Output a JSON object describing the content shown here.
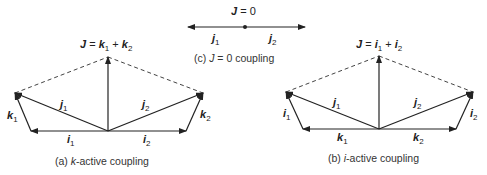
{
  "diagram_a": {
    "equation": {
      "lhs": "J",
      "eq": " = ",
      "v1": "k",
      "s1": "1",
      "plus": " + ",
      "v2": "k",
      "s2": "2"
    },
    "labels": {
      "j1": {
        "v": "j",
        "s": "1"
      },
      "j2": {
        "v": "j",
        "s": "2"
      },
      "k1": {
        "v": "k",
        "s": "1"
      },
      "k2": {
        "v": "k",
        "s": "2"
      },
      "i1": {
        "v": "i",
        "s": "1"
      },
      "i2": {
        "v": "i",
        "s": "2"
      }
    },
    "caption": {
      "prefix": "(a) ",
      "italic": "k",
      "suffix": "-active coupling"
    }
  },
  "diagram_b": {
    "equation": {
      "lhs": "J",
      "eq": " = ",
      "v1": "i",
      "s1": "1",
      "plus": " + ",
      "v2": "i",
      "s2": "2"
    },
    "labels": {
      "j1": {
        "v": "j",
        "s": "1"
      },
      "j2": {
        "v": "j",
        "s": "2"
      },
      "i1": {
        "v": "i",
        "s": "1"
      },
      "i2": {
        "v": "i",
        "s": "2"
      },
      "k1": {
        "v": "k",
        "s": "1"
      },
      "k2": {
        "v": "k",
        "s": "2"
      }
    },
    "caption": {
      "prefix": "(b) ",
      "italic": "i",
      "suffix": "-active coupling"
    }
  },
  "diagram_c": {
    "equation": {
      "lhs": "J",
      "eq": " = 0"
    },
    "labels": {
      "j1": {
        "v": "j",
        "s": "1"
      },
      "j2": {
        "v": "j",
        "s": "2"
      }
    },
    "caption": {
      "prefix": "(c) ",
      "italic": "J",
      "suffix": " = 0 coupling"
    }
  },
  "colors": {
    "line": "#222222",
    "dashed": "#444444",
    "text": "#222222"
  }
}
